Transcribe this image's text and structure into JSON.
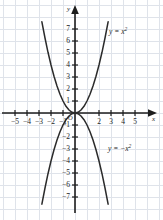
{
  "chart_data": {
    "type": "line",
    "title": "",
    "xlabel": "x",
    "ylabel": "y",
    "xlim": [
      -5.8,
      5.8
    ],
    "ylim": [
      -7.6,
      7.6
    ],
    "grid": true,
    "grid_step": 1,
    "legend": "inline-annotations",
    "axis_arrows": true,
    "origin_label": "O",
    "series": [
      {
        "name": "y = x²",
        "equation": "y = x^2",
        "annotation": "y = x",
        "annotation_exponent": "2",
        "color": "#2b2b2b",
        "x": [
          -2.76,
          -2.5,
          -2.25,
          -2.0,
          -1.75,
          -1.5,
          -1.25,
          -1.0,
          -0.75,
          -0.5,
          -0.25,
          0,
          0.25,
          0.5,
          0.75,
          1.0,
          1.25,
          1.5,
          1.75,
          2.0,
          2.25,
          2.5,
          2.76
        ],
        "y": [
          7.6,
          6.25,
          5.06,
          4.0,
          3.06,
          2.25,
          1.56,
          1.0,
          0.56,
          0.25,
          0.06,
          0,
          0.06,
          0.25,
          0.56,
          1.0,
          1.56,
          2.25,
          3.06,
          4.0,
          5.06,
          6.25,
          7.6
        ]
      },
      {
        "name": "y = -x²",
        "equation": "y = -x^2",
        "annotation": "y = −x",
        "annotation_exponent": "2",
        "color": "#2b2b2b",
        "x": [
          -2.76,
          -2.5,
          -2.25,
          -2.0,
          -1.75,
          -1.5,
          -1.25,
          -1.0,
          -0.75,
          -0.5,
          -0.25,
          0,
          0.25,
          0.5,
          0.75,
          1.0,
          1.25,
          1.5,
          1.75,
          2.0,
          2.25,
          2.5,
          2.76
        ],
        "y": [
          -7.6,
          -6.25,
          -5.06,
          -4.0,
          -3.06,
          -2.25,
          -1.56,
          -1.0,
          -0.56,
          -0.25,
          -0.06,
          0,
          -0.06,
          -0.25,
          -0.56,
          -1.0,
          -1.56,
          -2.25,
          -3.06,
          -4.0,
          -5.06,
          -6.25,
          -7.6
        ]
      }
    ],
    "x_ticks": [
      {
        "value": -5,
        "label": "−5"
      },
      {
        "value": -4,
        "label": "−4"
      },
      {
        "value": -3,
        "label": "−3"
      },
      {
        "value": -2,
        "label": "−2"
      },
      {
        "value": -1,
        "label": "−1"
      },
      {
        "value": 2,
        "label": "2"
      },
      {
        "value": 3,
        "label": "3"
      },
      {
        "value": 4,
        "label": "4"
      },
      {
        "value": 5,
        "label": "5"
      }
    ],
    "y_ticks": [
      {
        "value": 7,
        "label": "7"
      },
      {
        "value": 6,
        "label": "6"
      },
      {
        "value": 5,
        "label": "5"
      },
      {
        "value": 4,
        "label": "4"
      },
      {
        "value": 3,
        "label": "3"
      },
      {
        "value": 2,
        "label": "2"
      },
      {
        "value": 1,
        "label": "1"
      },
      {
        "value": -1,
        "label": "−1"
      },
      {
        "value": -2,
        "label": "−2"
      },
      {
        "value": -3,
        "label": "−3"
      },
      {
        "value": -4,
        "label": "−4"
      },
      {
        "value": -5,
        "label": "−5"
      },
      {
        "value": -6,
        "label": "−6"
      },
      {
        "value": -7,
        "label": "−7"
      }
    ],
    "colors": {
      "background": "#ffffff",
      "grid": "#dfe3ea",
      "axis": "#1d1d1d",
      "curve": "#2b2b2b",
      "text": "#1d1d1d"
    }
  }
}
